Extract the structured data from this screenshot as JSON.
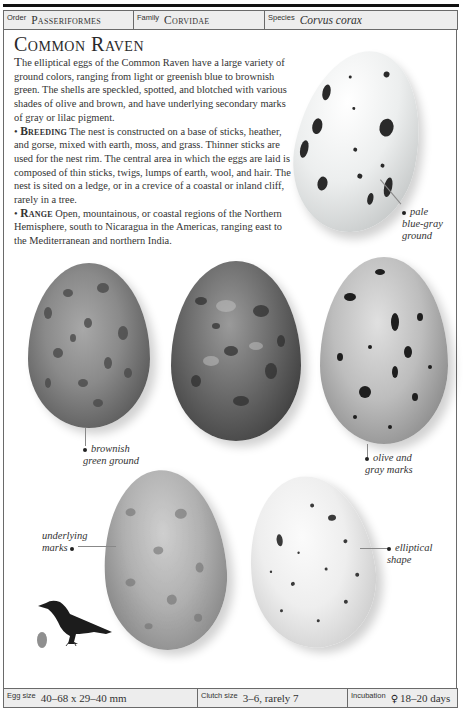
{
  "header": {
    "order_label": "Order",
    "order_value": "Passeriformes",
    "family_label": "Family",
    "family_value": "Corvidae",
    "species_label": "Species",
    "species_value": "Corvus corax"
  },
  "title": "Common Raven",
  "description": {
    "intro_dropcap": "T",
    "intro_text": "he elliptical eggs of the Common Raven have a large variety of ground colors, ranging from light or greenish blue to brownish green. The shells are speckled, spotted, and blotched with various shades of olive and brown, and have underlying secondary marks of gray or lilac pigment.",
    "breeding_bullet": "•",
    "breeding_heading": "Breeding",
    "breeding_text": "The nest is constructed on a base of sticks, heather, and gorse, mixed with earth, moss, and grass. Thinner sticks are used for the nest rim. The central area in which the eggs are laid is composed of thin sticks, twigs, lumps of earth, wool, and hair. The nest is sited on a ledge, or in a crevice of a coastal or inland cliff, rarely in a tree.",
    "range_bullet": "•",
    "range_heading": "Range",
    "range_text": "Open, mountainous, or coastal regions of the Northern Hemisphere, south to Nicaragua in the Americas, ranging east to the Mediterranean and northern India."
  },
  "callouts": {
    "pale_line1": "pale",
    "pale_line2": "blue-gray",
    "pale_line3": "ground",
    "brownish_line1": "brownish",
    "brownish_line2": "green ground",
    "olive_line1": "olive and",
    "olive_line2": "gray marks",
    "underlying_line1": "underlying",
    "underlying_line2": "marks",
    "elliptical_line1": "elliptical",
    "elliptical_line2": "shape"
  },
  "eggs": [
    {
      "id": "pale-blue-gray",
      "color": "#e4e6e6"
    },
    {
      "id": "brownish-green",
      "color": "#7c7c7c"
    },
    {
      "id": "dark-speckled",
      "color": "#5e5e5e"
    },
    {
      "id": "olive-gray",
      "color": "#b4b4b4"
    },
    {
      "id": "underlying-marks",
      "color": "#a6a6a6"
    },
    {
      "id": "elliptical-white",
      "color": "#ececec"
    }
  ],
  "footer": {
    "egg_size_label": "Egg size",
    "egg_size_value": "40–68 x 29–40 mm",
    "clutch_size_label": "Clutch size",
    "clutch_size_value": "3–6, rarely 7",
    "incubation_label": "Incubation",
    "incubation_symbol": "♀",
    "incubation_value": "18–20 days"
  }
}
